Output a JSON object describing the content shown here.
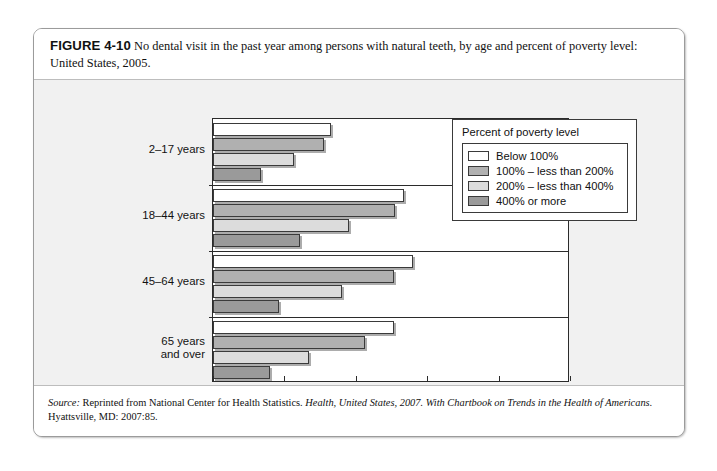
{
  "figure": {
    "number": "FIGURE 4-10",
    "caption": "No dental visit in the past year among persons with natural teeth, by age and percent of poverty level: United States, 2005."
  },
  "source": {
    "label": "Source:",
    "text_before": " Reprinted from National Center for Health Statistics. ",
    "italic_title": "Health, United States, 2007. With Chartbook on Trends in the Health of Americans.",
    "text_after": " Hyattsville, MD: 2007:85."
  },
  "legend": {
    "title": "Percent of poverty level",
    "items": [
      {
        "label": "Below 100%",
        "color": "#ffffff"
      },
      {
        "label": "100% – less than 200%",
        "color": "#b0b0b0"
      },
      {
        "label": "200% – less than 400%",
        "color": "#dcdcdc"
      },
      {
        "label": "400% or more",
        "color": "#9a9a9a"
      }
    ]
  },
  "chart_data": {
    "type": "bar",
    "orientation": "horizontal",
    "title": "No dental visit in the past year among persons with natural teeth, by age and percent of poverty level: United States, 2005",
    "xlabel": "Percent of persons with any natural teeth",
    "ylabel": "",
    "xlim": [
      0,
      100
    ],
    "xticks": [
      0,
      20,
      40,
      60,
      80,
      100
    ],
    "xtick_labels": [
      "0",
      "20",
      "40",
      "60",
      "80",
      "100"
    ],
    "grid": false,
    "legend_position": "upper right",
    "categories": [
      "2–17 years",
      "18–44 years",
      "45–64 years",
      "65 years\nand over"
    ],
    "category_labels": [
      {
        "line1": "2–17 years",
        "line2": ""
      },
      {
        "line1": "18–44 years",
        "line2": ""
      },
      {
        "line1": "45–64 years",
        "line2": ""
      },
      {
        "line1": "65 years",
        "line2": "and over"
      }
    ],
    "series": [
      {
        "name": "Below 100%",
        "color": "#ffffff",
        "values": [
          33.0,
          53.5,
          56.0,
          50.7
        ]
      },
      {
        "name": "100% – less than 200%",
        "color": "#b0b0b0",
        "values": [
          31.0,
          51.0,
          50.7,
          42.5
        ]
      },
      {
        "name": "200% – less than 400%",
        "color": "#dcdcdc",
        "values": [
          22.7,
          38.0,
          36.0,
          27.0
        ]
      },
      {
        "name": "400% or more",
        "color": "#9a9a9a",
        "values": [
          13.4,
          24.5,
          18.5,
          16.0
        ]
      }
    ]
  }
}
